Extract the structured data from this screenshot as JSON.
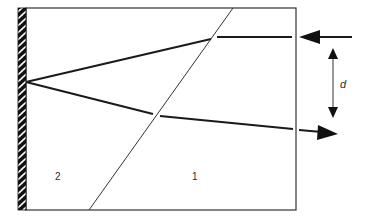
{
  "diagram": {
    "type": "ray-refraction",
    "regions": [
      {
        "id": "medium-1",
        "label": "1"
      },
      {
        "id": "medium-2",
        "label": "2"
      }
    ],
    "labels": {
      "region_2": "2",
      "region_1": "1",
      "separation": "d"
    },
    "elements": {
      "wall": "hatched-reflecting-surface",
      "interface": "diagonal-boundary",
      "incoming_ray": "arrow-left",
      "outgoing_ray": "arrow-right",
      "separation_arrow": "double-headed-vertical"
    },
    "colors": {
      "stroke": "#1a1a1a",
      "background": "#ffffff"
    }
  }
}
